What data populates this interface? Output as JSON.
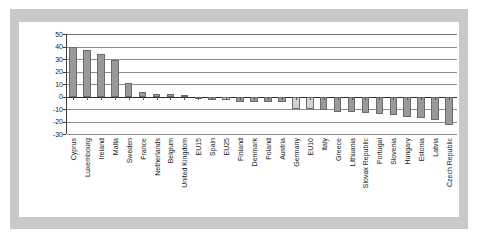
{
  "chart_data": {
    "type": "bar",
    "title": "",
    "subtitle": "",
    "xlabel": "",
    "ylabel": "",
    "ylim": [
      -30,
      50
    ],
    "yticks": [
      50,
      40,
      30,
      20,
      10,
      0,
      -10,
      -20,
      -30
    ],
    "grid": true,
    "legend": "none",
    "categories": [
      "Cyprus",
      "Luxembourg",
      "Ireland",
      "Malta",
      "Sweden",
      "France",
      "Netherlands",
      "Belgium",
      "United Kingdom",
      "EU15",
      "Spain",
      "EU25",
      "Finland",
      "Denmark",
      "Poland",
      "Austria",
      "Germany",
      "EU10",
      "Italy",
      "Greece",
      "Lithuania",
      "Slovak Republic",
      "Portugal",
      "Slovenia",
      "Hungary",
      "Estonia",
      "Latvia",
      "Czech Republic"
    ],
    "values": [
      40,
      37,
      34,
      29,
      11,
      4,
      2,
      2,
      1,
      -2,
      -3,
      -3,
      -4,
      -4,
      -4,
      -4,
      -10,
      -10,
      -11,
      -12,
      -12,
      -13,
      -14,
      -15,
      -16,
      -17,
      -19,
      -23
    ],
    "series": [
      {
        "name": "Value",
        "values": [
          40,
          37,
          34,
          29,
          11,
          4,
          2,
          2,
          1,
          -2,
          -3,
          -3,
          -4,
          -4,
          -4,
          -4,
          -10,
          -10,
          -11,
          -12,
          -12,
          -13,
          -14,
          -15,
          -16,
          -17,
          -19,
          -23
        ]
      }
    ],
    "aggregate_categories": [
      "EU15",
      "EU25",
      "EU10",
      "Germany"
    ],
    "colors": {
      "country_bar": "#9a9a9a",
      "aggregate_bar": "#d2d2d2",
      "bar_outline": "#6a6a6a",
      "gridline": "#8d8d8d",
      "axis": "#2b2b2b",
      "plate": "#ffffff",
      "scan_border": "#c9c9c9"
    }
  }
}
